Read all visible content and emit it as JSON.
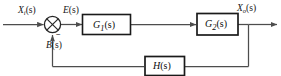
{
  "diagram": {
    "line_color": "#4d4d4d",
    "block_border_color": "#1a1a1a",
    "text_color": "#141414",
    "background": "#ffffff",
    "signals": {
      "input": {
        "base": "X",
        "sub": "i",
        "arg": "(s)",
        "full": "Xi(s)"
      },
      "error": {
        "base": "E",
        "sub": "",
        "arg": "(s)",
        "full": "E(s)"
      },
      "output": {
        "base": "X",
        "sub": "o",
        "arg": "(s)",
        "full": "Xo(s)"
      },
      "feedback": {
        "base": "B",
        "sub": "",
        "arg": "(s)",
        "full": "B(s)"
      }
    },
    "blocks": [
      {
        "name": "g1-block",
        "base": "G",
        "sub": "1",
        "arg": "(s)",
        "full": "G1(s)"
      },
      {
        "name": "g2-block",
        "base": "G",
        "sub": "2",
        "arg": "(s)",
        "full": "G2(s)"
      },
      {
        "name": "h-block",
        "base": "H",
        "sub": "",
        "arg": "(s)",
        "full": "H(s)"
      }
    ],
    "summing_junction": {
      "name": "summing-junction",
      "glyph": "circle-with-x",
      "feedback_sign": "−"
    }
  }
}
